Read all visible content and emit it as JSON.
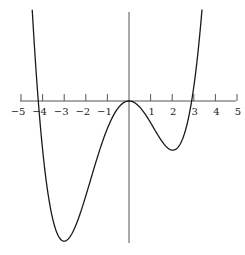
{
  "chart_data": {
    "type": "line",
    "title": "",
    "xlabel": "",
    "ylabel": "",
    "function_description": "quartic polynomial y = a·x²(x+4.2)(x−2.9)",
    "roots": [
      -4.2,
      0,
      0,
      2.9
    ],
    "local_maximum": {
      "x": 0,
      "y": 0
    },
    "local_minima": [
      {
        "x": -3.0,
        "y": -63.7
      },
      {
        "x": 2.03,
        "y": -22.3
      }
    ],
    "xlim": [
      -5,
      5
    ],
    "x_ticks": [
      -5,
      -4,
      -3,
      -2,
      -1,
      1,
      2,
      3,
      4,
      5
    ],
    "x_tick_labels": [
      "−5",
      "−4",
      "−3",
      "−2",
      "−1",
      "1",
      "2",
      "3",
      "4",
      "5"
    ],
    "y_ticks": [],
    "grid": false,
    "legend": null,
    "series": [
      {
        "name": "f(x)",
        "x": [
          -4.48,
          -4.2,
          -4.0,
          -3.5,
          -3.0,
          -2.5,
          -2.0,
          -1.5,
          -1.0,
          -0.5,
          0,
          0.5,
          1.0,
          1.5,
          2.0,
          2.5,
          2.9,
          3.2,
          3.38
        ],
        "y": [
          41.4,
          0,
          -15.2,
          -53.3,
          -63.7,
          -53.6,
          -35.2,
          -17.8,
          -6.1,
          -0.85,
          0,
          -0.64,
          -3.84,
          -7.6,
          -21.9,
          -15.2,
          0,
          22.6,
          39.8
        ]
      }
    ],
    "colors": {
      "curve": "#1a1a1a",
      "axis": "#555555"
    }
  }
}
